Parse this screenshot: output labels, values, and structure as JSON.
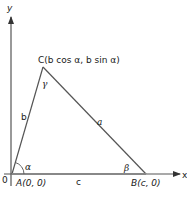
{
  "diagram": {
    "type": "triangle-on-coordinate-axes",
    "axes": {
      "x_label": "x",
      "y_label": "y",
      "origin_label": "0"
    },
    "vertices": {
      "A": {
        "label": "A(0, 0)"
      },
      "B": {
        "label": "B(c, 0)"
      },
      "C": {
        "label": "C(b cos α, b sin α)"
      }
    },
    "sides": {
      "a": "a",
      "b": "b",
      "c": "c"
    },
    "angles": {
      "alpha": "α",
      "beta": "β",
      "gamma": "γ"
    },
    "colors": {
      "line": "#4a4a4a",
      "text": "#1a1a1a",
      "background": "#ffffff"
    }
  }
}
